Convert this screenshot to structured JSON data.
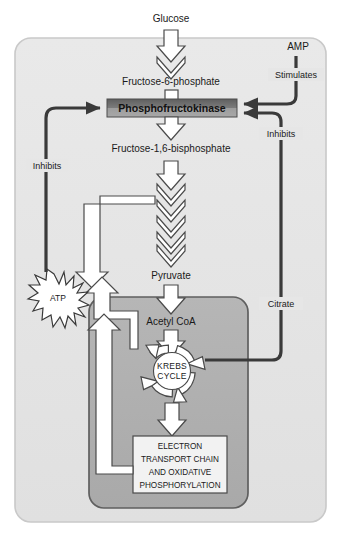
{
  "diagram": {
    "colors": {
      "cytosol": "#e6e6e6",
      "cell_border": "#cfcfcf",
      "mitochondrion": "#b0b0b0",
      "mitochondrion_border": "#6e6e6e",
      "pfk_box_top": "#6e6e6e",
      "pfk_box_bottom": "#9a9a9a",
      "regulator_line": "#3a3a3a",
      "pathway_arrow_fill": "#ffffff",
      "pathway_arrow_stroke": "#444444",
      "text": "#1a1a1a"
    },
    "metabolites": {
      "glucose": "Glucose",
      "f6p": "Fructose-6-phosphate",
      "f16bp": "Fructose-1,6-bisphosphate",
      "pyruvate": "Pyruvate",
      "acetyl_coa": "Acetyl CoA",
      "atp": "ATP",
      "amp": "AMP",
      "citrate": "Citrate"
    },
    "enzyme": {
      "name": "Phosphofructokinase"
    },
    "processes": {
      "krebs_line1": "KREBS",
      "krebs_line2": "CYCLE",
      "etc_line1": "ELECTRON",
      "etc_line2": "TRANSPORT CHAIN",
      "etc_line3": "AND OXIDATIVE",
      "etc_line4": "PHOSPHORYLATION"
    },
    "regulation": {
      "amp_effect": "Stimulates",
      "atp_effect": "Inhibits",
      "citrate_effect": "Inhibits"
    },
    "compartments": {
      "cytosol": "cytosol",
      "mitochondrion": "mitochondrion"
    }
  }
}
